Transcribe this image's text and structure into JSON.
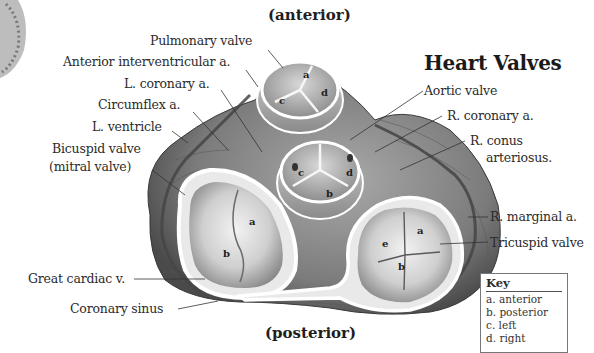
{
  "diagram": {
    "title": "Heart Valves",
    "orientation_top": "(anterior)",
    "orientation_bottom": "(posterior)",
    "labels_left": [
      "Pulmonary valve",
      "Anterior interventricular a.",
      "L. coronary a.",
      "Circumflex a.",
      "L. ventricle",
      "Bicuspid valve",
      "(mitral valve)",
      "Great cardiac v.",
      "Coronary sinus"
    ],
    "labels_right": [
      "Aortic valve",
      "R. coronary a.",
      "R. conus",
      "arteriosus.",
      "R. marginal a.",
      "Tricuspid valve"
    ],
    "cusp_letters": {
      "pulmonary": [
        "a",
        "c",
        "d"
      ],
      "aortic": [
        "c",
        "d",
        "b"
      ],
      "mitral": [
        "a",
        "b"
      ],
      "tricuspid": [
        "e",
        "a",
        "b"
      ]
    },
    "key": {
      "title": "Key",
      "items": [
        "a. anterior",
        "b. posterior",
        "c. left",
        "d. right"
      ]
    },
    "colors": {
      "tissue_dark": "#5a5a5a",
      "tissue_mid": "#8c8c8c",
      "tissue_light": "#c8c8c8",
      "annulus": "#f4f4f4",
      "text": "#2b2b2b"
    }
  }
}
